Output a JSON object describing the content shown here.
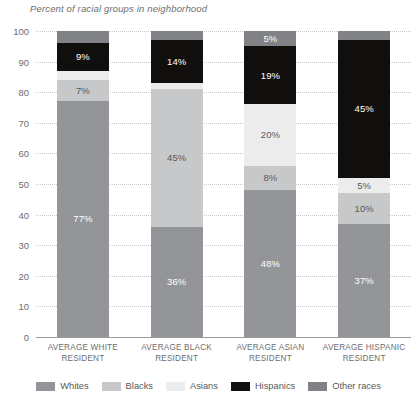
{
  "chart_data": {
    "type": "bar",
    "title": "Percent of racial groups in neighborhood",
    "xlabel": "",
    "ylabel": "",
    "ylim": [
      0,
      100
    ],
    "ytick_values": [
      100,
      90,
      80,
      70,
      60,
      50,
      40,
      30,
      20,
      10,
      0
    ],
    "grid": true,
    "stacked": true,
    "legend_position": "bottom",
    "label_threshold_percent": 5,
    "categories": [
      "AVERAGE WHITE RESIDENT",
      "AVERAGE BLACK RESIDENT",
      "AVERAGE ASIAN RESIDENT",
      "AVERAGE HISPANIC RESIDENT"
    ],
    "series": [
      {
        "name": "Whites",
        "color": "#939598",
        "label_color": "#ffffff",
        "values": [
          77,
          36,
          48,
          37
        ]
      },
      {
        "name": "Blacks",
        "color": "#c7c8ca",
        "label_color": "#58595b",
        "values": [
          7,
          45,
          8,
          10
        ]
      },
      {
        "name": "Asians",
        "color": "#ececec",
        "label_color": "#58595b",
        "values": [
          3,
          2,
          20,
          5
        ]
      },
      {
        "name": "Hispanics",
        "color": "#100f0d",
        "label_color": "#ffffff",
        "values": [
          9,
          14,
          19,
          45
        ]
      },
      {
        "name": "Other races",
        "color": "#808285",
        "label_color": "#ffffff",
        "values": [
          4,
          3,
          5,
          3
        ]
      }
    ]
  },
  "colors": {
    "background": "#ffffff",
    "text": "#58595b",
    "axis": "#9a9a9a",
    "gridline": "#c9c9c9"
  }
}
